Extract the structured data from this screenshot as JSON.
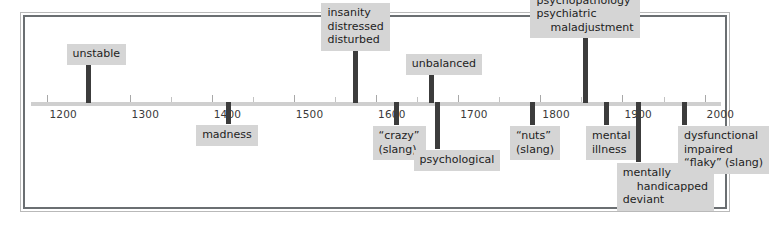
{
  "figure": {
    "title": "",
    "type": "timeline",
    "orientation": "horizontal"
  },
  "colors": {
    "frame_outer": "#b9b9b9",
    "frame_inner": "#6b6f72",
    "background": "#ffffff",
    "chip_background": "#d5d5d5",
    "chip_text": "#1d1d1d",
    "stem": "#3c3c3c",
    "axis": "#cfcfcf",
    "tick_label": "#3a3a3a"
  },
  "chart_data": {
    "type": "timeline",
    "title": "",
    "xlabel": "",
    "ylabel": "",
    "xlim": [
      1180,
      2020
    ],
    "grid": false,
    "legend": null,
    "axis": {
      "major_ticks": [
        1200,
        1300,
        1400,
        1500,
        1600,
        1700,
        1800,
        1900,
        2000
      ],
      "major_tick_labels": [
        "1200",
        "1300",
        "1400",
        "1500",
        "1600",
        "1700",
        "1800",
        "1900",
        "2000"
      ],
      "minor_tick_interval": 50,
      "minor_ticks": [
        1250,
        1350,
        1450,
        1550,
        1650,
        1750,
        1850,
        1950
      ]
    },
    "events": [
      {
        "id": "unstable",
        "year": 1250,
        "side": "above",
        "lines": [
          "unstable"
        ],
        "indent": [
          false
        ]
      },
      {
        "id": "madness",
        "year": 1420,
        "side": "below",
        "lines": [
          "madness"
        ],
        "indent": [
          false
        ]
      },
      {
        "id": "insanity-distressed-disturbed",
        "year": 1575,
        "side": "above",
        "lines": [
          "insanity",
          "distressed",
          "disturbed"
        ],
        "indent": [
          false,
          false,
          false
        ]
      },
      {
        "id": "crazy-slang",
        "year": 1625,
        "side": "below",
        "lines": [
          "“crazy”",
          "(slang)"
        ],
        "indent": [
          false,
          false
        ]
      },
      {
        "id": "psychological",
        "year": 1675,
        "side": "below",
        "lines": [
          "psychological"
        ],
        "indent": [
          false
        ]
      },
      {
        "id": "unbalanced",
        "year": 1668,
        "side": "above",
        "lines": [
          "unbalanced"
        ],
        "indent": [
          false
        ]
      },
      {
        "id": "nuts-slang",
        "year": 1790,
        "side": "below",
        "lines": [
          "“nuts”",
          "(slang)"
        ],
        "indent": [
          false,
          false
        ]
      },
      {
        "id": "abnormal-psychopathology-psychiatric-maladjustment",
        "year": 1855,
        "side": "above",
        "lines": [
          "abnormal",
          "psychopathology",
          "psychiatric",
          "maladjustment"
        ],
        "indent": [
          false,
          false,
          false,
          true
        ]
      },
      {
        "id": "mental-illness",
        "year": 1880,
        "side": "below",
        "lines": [
          "mental",
          "illness"
        ],
        "indent": [
          false,
          false
        ]
      },
      {
        "id": "mentally-handicapped-deviant",
        "year": 1920,
        "side": "below",
        "lines": [
          "mentally",
          "handicapped",
          "deviant"
        ],
        "indent": [
          false,
          true,
          false
        ]
      },
      {
        "id": "dysfunctional-impaired-flaky",
        "year": 1975,
        "side": "below",
        "lines": [
          "dysfunctional",
          "impaired",
          "“flaky” (slang)"
        ],
        "indent": [
          false,
          false,
          false
        ]
      }
    ]
  }
}
